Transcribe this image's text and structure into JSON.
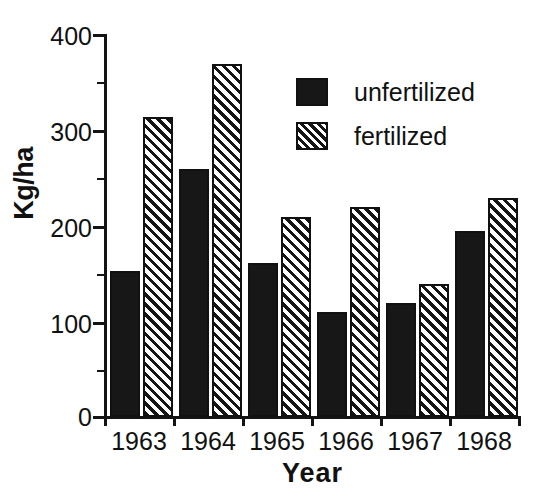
{
  "chart_data": {
    "type": "bar",
    "title": "",
    "xlabel": "Year",
    "ylabel": "Kg/ha",
    "categories": [
      "1963",
      "1964",
      "1965",
      "1966",
      "1967",
      "1968"
    ],
    "series": [
      {
        "name": "unfertilized",
        "values": [
          153,
          259,
          161,
          110,
          119,
          194
        ],
        "fill": "solid",
        "color": "#171717"
      },
      {
        "name": "fertilized",
        "values": [
          313,
          369,
          209,
          219,
          139,
          229
        ],
        "fill": "hatch",
        "color": "#151515"
      }
    ],
    "ylim": [
      0,
      400
    ],
    "yticks": [
      0,
      100,
      200,
      300,
      400
    ],
    "ytick_labels": [
      "0",
      "100",
      "200",
      "300",
      "400"
    ],
    "yticks_minor": [
      50,
      150,
      250,
      350
    ],
    "grid": false,
    "legend_position": "upper right",
    "legend_entries": [
      "unfertilized",
      "fertilized"
    ]
  }
}
